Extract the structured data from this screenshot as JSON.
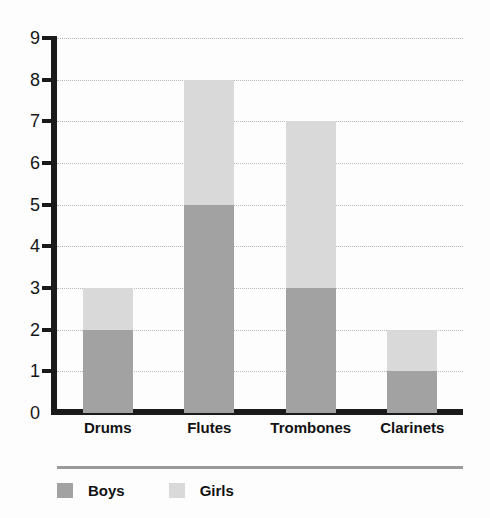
{
  "chart_data": {
    "type": "bar",
    "subtype": "stacked-vertical",
    "title": "",
    "xlabel": "",
    "ylabel": "",
    "categories": [
      "Drums",
      "Flutes",
      "Trombones",
      "Clarinets"
    ],
    "series": [
      {
        "name": "Boys",
        "values": [
          2,
          5,
          3,
          1
        ],
        "color": "#a2a2a2"
      },
      {
        "name": "Girls",
        "values": [
          1,
          3,
          4,
          1
        ],
        "color": "#d9d9d9"
      }
    ],
    "totals": [
      3,
      8,
      7,
      2
    ],
    "ylim": [
      0,
      9
    ],
    "y_ticks": [
      0,
      1,
      2,
      3,
      4,
      5,
      6,
      7,
      8,
      9
    ],
    "y_tick_labels": [
      "0",
      "1",
      "2",
      "3",
      "4",
      "5",
      "6",
      "7",
      "8",
      "9"
    ],
    "grid": true,
    "grid_style": "dotted",
    "grid_axis": "y",
    "legend_position": "bottom-left",
    "axis_color": "#1a1a1a",
    "grid_color": "#b9b9b9",
    "background": "#fdfdfd"
  },
  "legend": {
    "items": [
      {
        "label": "Boys",
        "color": "#a2a2a2"
      },
      {
        "label": "Girls",
        "color": "#d9d9d9"
      }
    ]
  }
}
